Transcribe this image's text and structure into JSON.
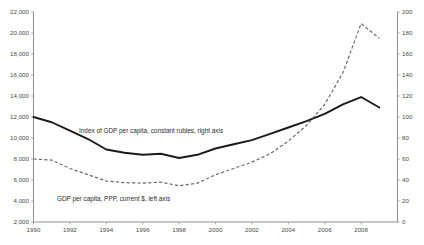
{
  "chart_data": {
    "type": "line",
    "title": "",
    "subtitle": "",
    "xlabel": "",
    "ylabel": "",
    "grid": false,
    "legend_position": "inline-annotations",
    "x": [
      1990,
      1991,
      1992,
      1993,
      1994,
      1995,
      1996,
      1997,
      1998,
      1999,
      2000,
      2001,
      2002,
      2003,
      2004,
      2005,
      2006,
      2007,
      2008,
      2009
    ],
    "x_tick_labels": [
      "1990",
      "1992",
      "1994",
      "1996",
      "1998",
      "2000",
      "2002",
      "2004",
      "2006",
      "2008"
    ],
    "x_ticks": [
      1990,
      1992,
      1994,
      1996,
      1998,
      2000,
      2002,
      2004,
      2006,
      2008
    ],
    "xlim": [
      1990,
      2010
    ],
    "axes": [
      {
        "id": "left",
        "label": "GDP per capita, PPP, current $",
        "ylim": [
          2000,
          22000
        ],
        "ticks": [
          2000,
          4000,
          6000,
          8000,
          10000,
          12000,
          14000,
          16000,
          18000,
          20000,
          22000
        ],
        "tick_labels": [
          "2,000",
          "4,000",
          "6,000",
          "8,000",
          "10,000",
          "12,000",
          "14,000",
          "16,000",
          "18,000",
          "20,000",
          "22,000"
        ]
      },
      {
        "id": "right",
        "label": "Index of GDP per capita, constant rubles",
        "ylim": [
          0,
          200
        ],
        "ticks": [
          0,
          20,
          40,
          60,
          80,
          100,
          120,
          140,
          160,
          180,
          200
        ],
        "tick_labels": [
          "0",
          "20",
          "40",
          "60",
          "80",
          "100",
          "120",
          "140",
          "160",
          "180",
          "200"
        ]
      }
    ],
    "series": [
      {
        "name": "Index of GDP per capita, constant rubles, right axis",
        "axis": "right",
        "style": "solid",
        "color": "#1a1a1a",
        "values": [
          100,
          95,
          87,
          79,
          69,
          66,
          64,
          65,
          61,
          64,
          70,
          74,
          78,
          84,
          90,
          96,
          103,
          112,
          119,
          109
        ]
      },
      {
        "name": "GDP per capita, PPP, current $, left axis",
        "axis": "left",
        "style": "dashed",
        "color": "#6b6b6b",
        "values": [
          8000,
          7900,
          7100,
          6500,
          5900,
          5750,
          5700,
          5800,
          5450,
          5700,
          6500,
          7100,
          7700,
          8500,
          9700,
          11200,
          13200,
          16200,
          20900,
          19500
        ]
      }
    ],
    "annotations": [
      {
        "text": "Index of GDP per capita, constant rubles, right axis",
        "x_px": 79,
        "y_px": 133
      },
      {
        "text": "GDP per capita, PPP, current $, left axis",
        "x_px": 57,
        "y_px": 201
      }
    ]
  },
  "figure": {
    "background": "#ffffff",
    "axis_color": "#808080",
    "text_color": "#4a4a4a"
  }
}
